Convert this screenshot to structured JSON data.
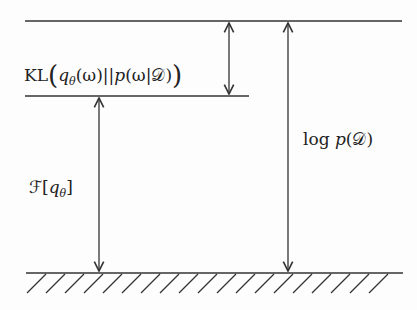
{
  "diagram": {
    "labels": {
      "kl_prefix": "KL",
      "kl_q": "q",
      "kl_q_sub": "θ",
      "kl_q_arg": "(ω)",
      "kl_sep": "||",
      "kl_p": "p",
      "kl_p_arg": "(ω|𝒟)",
      "free_F": "ℱ",
      "free_bracket_open": "[",
      "free_q": "q",
      "free_q_sub": "θ",
      "free_bracket_close": "]",
      "logp_log": "log",
      "logp_p": "p",
      "logp_arg": "(𝒟)"
    },
    "levels": [
      "log p(𝒟)",
      "ℱ[q_θ]",
      "ground"
    ],
    "arrows": [
      {
        "name": "kl-gap",
        "from": "log p(𝒟)",
        "to": "ℱ[q_θ]",
        "direction": "double"
      },
      {
        "name": "elbo",
        "from": "ℱ[q_θ]",
        "to": "ground",
        "direction": "double"
      },
      {
        "name": "log-evidence",
        "from": "log p(𝒟)",
        "to": "ground",
        "direction": "double"
      }
    ],
    "stroke_color": "#333333"
  }
}
